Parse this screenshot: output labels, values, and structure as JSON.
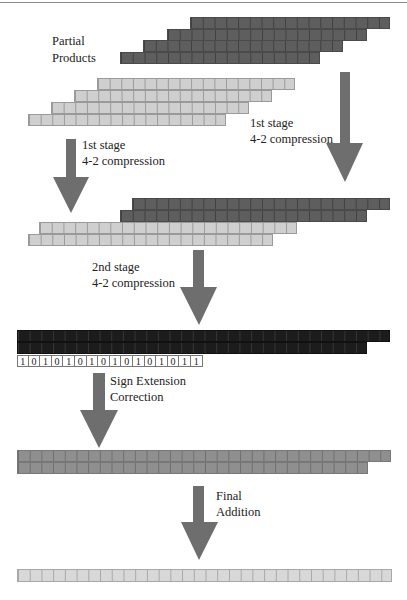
{
  "diagram": {
    "labels": {
      "partial_products_line1": "Partial",
      "partial_products_line2": "Products",
      "stage1_right_line1": "1st stage",
      "stage1_right_line2": "4-2 compression",
      "stage1_left_line1": "1st stage",
      "stage1_left_line2": "4-2 compression",
      "stage2_line1": "2nd stage",
      "stage2_line2": "4-2 compression",
      "sign_line1": "Sign Extension",
      "sign_line2": "Correction",
      "final_line1": "Final",
      "final_line2": "Addition"
    },
    "sign_correction_bits": [
      "1",
      "0",
      "1",
      "0",
      "1",
      "0",
      "1",
      "0",
      "1",
      "0",
      "1",
      "0",
      "1",
      "0",
      "1",
      "1"
    ],
    "colors": {
      "dark_gray": "#5e5e5e",
      "light_gray": "#cfcfcf",
      "black": "#1c1c1c",
      "mid_gray": "#8f8f8f",
      "arrow": "#6e6e6e"
    },
    "stages": [
      {
        "name": "partial-products-dark",
        "rows": 4,
        "cells_per_row": 17
      },
      {
        "name": "partial-products-light",
        "rows": 4,
        "cells_per_row": 17
      },
      {
        "name": "after-stage1",
        "rows": 4
      },
      {
        "name": "after-stage2",
        "rows": 2
      },
      {
        "name": "after-sign-correction",
        "rows": 2
      },
      {
        "name": "final-result",
        "rows": 1,
        "cells": 32
      }
    ]
  }
}
